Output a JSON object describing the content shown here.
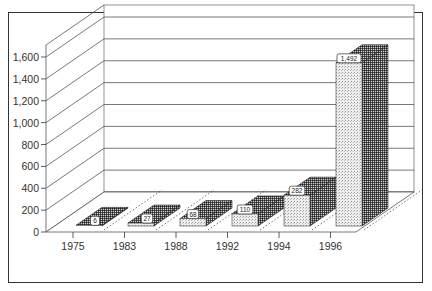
{
  "chart_data": {
    "type": "bar",
    "title": "",
    "xlabel": "",
    "ylabel": "",
    "categories": [
      "1975",
      "1983",
      "1988",
      "1992",
      "1994",
      "1996"
    ],
    "series": [
      {
        "name": "front",
        "values": [
          6,
          27,
          68,
          110,
          282,
          1492
        ]
      },
      {
        "name": "back",
        "values": [
          6,
          27,
          68,
          110,
          282,
          1492
        ]
      }
    ],
    "data_labels": [
      "6",
      "27",
      "68",
      "110",
      "282",
      "1,492"
    ],
    "ylim": [
      0,
      1600
    ],
    "yticks": [
      "0",
      "200",
      "400",
      "600",
      "800",
      "1,000",
      "1,200",
      "1,400",
      "1,600"
    ],
    "grid": true,
    "style": "3d"
  }
}
